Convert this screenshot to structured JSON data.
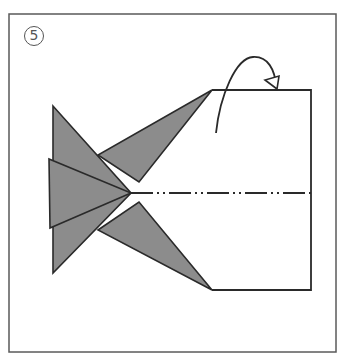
{
  "step": {
    "number": "5"
  },
  "colors": {
    "frame": "#5a5a5a",
    "outline": "#2a2a2a",
    "flap_fill": "#8c8c8c",
    "background": "#ffffff"
  },
  "diagram": {
    "frame": {
      "x": 9,
      "y": 14,
      "w": 327,
      "h": 338
    },
    "paper_rect": {
      "left": 212,
      "top": 90,
      "right": 311,
      "bottom": 290
    },
    "center_line": {
      "y": 193,
      "x1": 131,
      "x2": 311,
      "style": "dash-dot-dot"
    },
    "flaps": [
      {
        "name": "upper-left-triangle",
        "points": "53,106 53,193 131,193"
      },
      {
        "name": "lower-left-triangle",
        "points": "53,273 53,193 131,193"
      },
      {
        "name": "middle-triangle",
        "points": "49,159 50,228 131,193"
      },
      {
        "name": "upper-flap",
        "points": "212,90 98,155 139,182"
      },
      {
        "name": "lower-flap",
        "points": "212,290 98,230 139,202"
      }
    ],
    "arrow": {
      "type": "mountain-fold-over",
      "path": "M216,133 C222,95 236,58 253,57 C268,56 276,70 277,88"
    }
  }
}
